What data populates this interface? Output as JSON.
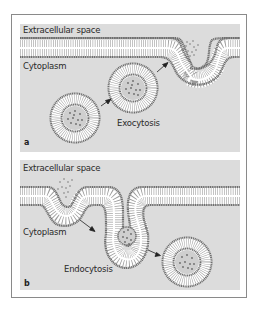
{
  "figure": {
    "panels": [
      {
        "id": "a",
        "tag": "a",
        "labels": {
          "extracellular": "Extracellular space",
          "cytoplasm": "Cytoplasm",
          "process": "Exocytosis"
        }
      },
      {
        "id": "b",
        "tag": "b",
        "labels": {
          "extracellular": "Extracellular space",
          "cytoplasm": "Cytoplasm",
          "process": "Endocytosis"
        }
      }
    ],
    "colors": {
      "background": "#dcdcdc",
      "membrane_head": "#6e6e6e",
      "membrane_tail": "#ffffff",
      "cargo": "#7a7a7a",
      "arrow": "#222222",
      "frame_border": "#8a8a8a"
    }
  }
}
